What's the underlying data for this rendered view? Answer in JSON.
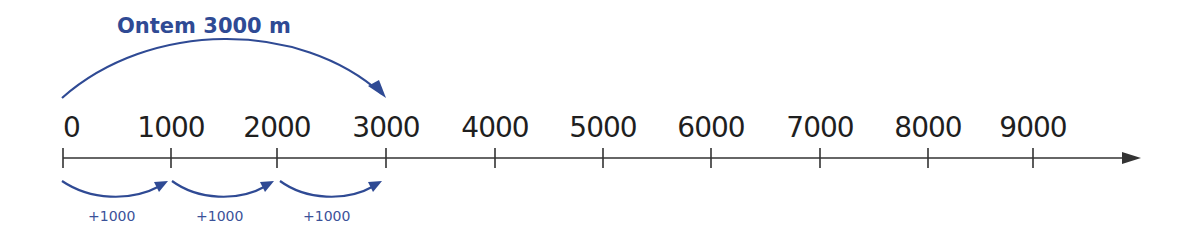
{
  "title": "Ontem 3000 m",
  "colors": {
    "accent": "#2f4a94",
    "axis": "#333333",
    "text": "#1f1f1f"
  },
  "ticks": [
    {
      "label": "0",
      "x": 63
    },
    {
      "label": "1000",
      "x": 171
    },
    {
      "label": "2000",
      "x": 277
    },
    {
      "label": "3000",
      "x": 386
    },
    {
      "label": "4000",
      "x": 495
    },
    {
      "label": "5000",
      "x": 603
    },
    {
      "label": "6000",
      "x": 711
    },
    {
      "label": "7000",
      "x": 820
    },
    {
      "label": "8000",
      "x": 928
    },
    {
      "label": "9000",
      "x": 1033
    }
  ],
  "steps": [
    {
      "label": "+1000",
      "from": 0,
      "to": 1000
    },
    {
      "label": "+1000",
      "from": 1000,
      "to": 2000
    },
    {
      "label": "+1000",
      "from": 2000,
      "to": 3000
    }
  ],
  "big_jump": {
    "from": 0,
    "to": 3000
  }
}
